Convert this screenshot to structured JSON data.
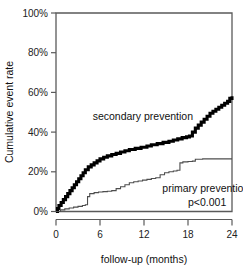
{
  "chart_data": {
    "type": "line",
    "title": "",
    "xlabel": "follow-up (months)",
    "ylabel": "Cumulative event rate",
    "xlim": [
      0,
      24
    ],
    "ylim": [
      0,
      100
    ],
    "grid": false,
    "legend_position": "inline-annotation",
    "x_ticks": [
      "0",
      "6",
      "12",
      "18",
      "24"
    ],
    "x_tick_values": [
      0,
      6,
      12,
      18,
      24
    ],
    "y_ticks": [
      "0%",
      "20%",
      "40%",
      "60%",
      "80%",
      "100%"
    ],
    "y_tick_values": [
      0,
      20,
      40,
      60,
      80,
      100
    ],
    "annotations": [
      {
        "text": "secondary prevention",
        "x": 5.0,
        "y": 46
      },
      {
        "text": "primary prevention",
        "x": 14.5,
        "y": 10
      },
      {
        "text": "p<0.001",
        "x": 18.0,
        "y": 3
      }
    ],
    "series": [
      {
        "name": "secondary prevention",
        "style": "bold-step",
        "points": [
          [
            0.0,
            0.0
          ],
          [
            0.2,
            1.5
          ],
          [
            0.4,
            3.0
          ],
          [
            0.7,
            4.5
          ],
          [
            1.0,
            6.0
          ],
          [
            1.3,
            7.5
          ],
          [
            1.6,
            9.0
          ],
          [
            1.9,
            10.5
          ],
          [
            2.2,
            12.0
          ],
          [
            2.5,
            13.5
          ],
          [
            2.8,
            15.0
          ],
          [
            3.1,
            16.5
          ],
          [
            3.4,
            18.0
          ],
          [
            3.7,
            19.5
          ],
          [
            4.0,
            21.0
          ],
          [
            4.4,
            22.5
          ],
          [
            4.8,
            23.5
          ],
          [
            5.2,
            24.5
          ],
          [
            5.6,
            25.5
          ],
          [
            6.0,
            26.5
          ],
          [
            6.5,
            27.3
          ],
          [
            7.0,
            28.0
          ],
          [
            7.6,
            28.7
          ],
          [
            8.2,
            29.3
          ],
          [
            8.8,
            30.0
          ],
          [
            9.4,
            30.6
          ],
          [
            10.0,
            31.2
          ],
          [
            10.8,
            31.8
          ],
          [
            11.6,
            32.4
          ],
          [
            12.4,
            33.0
          ],
          [
            13.0,
            33.6
          ],
          [
            13.8,
            34.2
          ],
          [
            14.6,
            34.8
          ],
          [
            15.4,
            35.4
          ],
          [
            16.0,
            36.0
          ],
          [
            16.6,
            36.6
          ],
          [
            17.2,
            37.2
          ],
          [
            17.8,
            37.6
          ],
          [
            18.2,
            38.0
          ],
          [
            18.6,
            40.0
          ],
          [
            19.0,
            42.0
          ],
          [
            19.4,
            43.5
          ],
          [
            19.8,
            45.0
          ],
          [
            20.2,
            46.5
          ],
          [
            20.6,
            48.0
          ],
          [
            21.0,
            49.5
          ],
          [
            21.4,
            50.5
          ],
          [
            21.8,
            51.5
          ],
          [
            22.2,
            52.5
          ],
          [
            22.6,
            53.5
          ],
          [
            23.0,
            54.5
          ],
          [
            23.4,
            55.5
          ],
          [
            23.7,
            57.0
          ],
          [
            24.0,
            58.0
          ]
        ]
      },
      {
        "name": "primary prevention",
        "style": "thin-step",
        "points": [
          [
            0.0,
            0.0
          ],
          [
            0.6,
            0.8
          ],
          [
            1.2,
            1.3
          ],
          [
            1.8,
            1.8
          ],
          [
            2.4,
            2.2
          ],
          [
            3.0,
            2.6
          ],
          [
            3.6,
            3.0
          ],
          [
            4.0,
            3.4
          ],
          [
            4.3,
            7.5
          ],
          [
            4.6,
            9.0
          ],
          [
            5.2,
            9.5
          ],
          [
            5.8,
            9.8
          ],
          [
            6.4,
            10.0
          ],
          [
            7.0,
            10.2
          ],
          [
            7.6,
            10.5
          ],
          [
            8.2,
            11.5
          ],
          [
            8.8,
            12.5
          ],
          [
            9.4,
            13.5
          ],
          [
            10.0,
            14.5
          ],
          [
            10.6,
            15.0
          ],
          [
            11.2,
            15.4
          ],
          [
            11.8,
            15.8
          ],
          [
            12.4,
            16.2
          ],
          [
            13.0,
            16.6
          ],
          [
            13.6,
            17.0
          ],
          [
            14.2,
            18.5
          ],
          [
            14.8,
            19.5
          ],
          [
            15.4,
            20.0
          ],
          [
            16.0,
            20.4
          ],
          [
            16.5,
            20.8
          ],
          [
            16.9,
            24.5
          ],
          [
            17.3,
            25.0
          ],
          [
            18.0,
            25.2
          ],
          [
            18.6,
            25.4
          ],
          [
            19.0,
            26.3
          ],
          [
            20.0,
            26.5
          ],
          [
            21.0,
            26.5
          ],
          [
            22.0,
            26.5
          ],
          [
            23.0,
            26.5
          ],
          [
            24.0,
            26.5
          ]
        ]
      }
    ]
  },
  "figure": {
    "background_color": "#ffffff",
    "axis_color": "#5a5a5a",
    "secondary_curve_color": "#000000",
    "primary_curve_color": "#4d4d4d"
  }
}
